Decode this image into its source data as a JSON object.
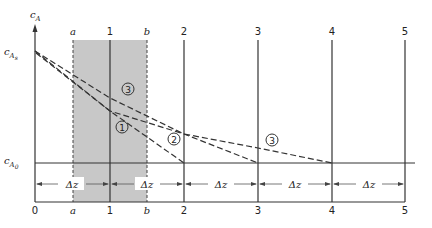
{
  "diagram": {
    "y_axis_label": "c",
    "y_axis_label_sub": "A",
    "c_as_label": "c",
    "c_as_sub": "A",
    "c_as_subsub": "s",
    "c_a0_label": "c",
    "c_a0_sub": "A",
    "c_a0_subsub": "0",
    "top_labels": [
      "a",
      "1",
      "b",
      "2",
      "3",
      "4",
      "5"
    ],
    "bottom_labels": [
      "0",
      "a",
      "1",
      "b",
      "2",
      "3",
      "4",
      "5"
    ],
    "delta_z_label": "Δz",
    "delta_z_count": 5,
    "curve_labels": {
      "curve1": "1",
      "curve2": "2",
      "curve3_upper": "3",
      "curve3_lower": "3"
    },
    "shaded_region": "between planes a and b",
    "colors": {
      "shade": "#c8c8c8",
      "line": "#333333"
    }
  }
}
